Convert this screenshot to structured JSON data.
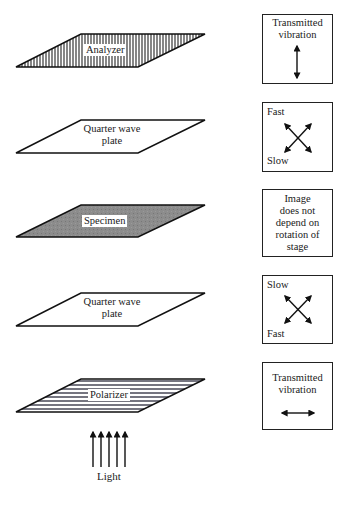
{
  "diagram": {
    "layers": [
      {
        "id": "analyzer",
        "label": "Analyzer",
        "fill": "vertical-stripes"
      },
      {
        "id": "quarter-wave-plate-top",
        "label_line1": "Quarter wave",
        "label_line2": "plate",
        "fill": "white"
      },
      {
        "id": "specimen",
        "label": "Specimen",
        "fill": "#8c8c8c"
      },
      {
        "id": "quarter-wave-plate-bottom",
        "label_line1": "Quarter wave",
        "label_line2": "plate",
        "fill": "white"
      },
      {
        "id": "polarizer",
        "label": "Polarizer",
        "fill": "horizontal-stripes"
      }
    ],
    "info_boxes": [
      {
        "id": "analyzer-info",
        "line1": "Transmitted",
        "line2": "vibration",
        "icon": "vertical-double-arrow-icon"
      },
      {
        "id": "qwp-top-info",
        "top_label": "Fast",
        "bottom_label": "Slow",
        "icon": "crossed-double-arrows-icon"
      },
      {
        "id": "specimen-info",
        "lines": [
          "Image",
          "does not",
          "depend on",
          "rotation of",
          "stage"
        ]
      },
      {
        "id": "qwp-bottom-info",
        "top_label": "Slow",
        "bottom_label": "Fast",
        "icon": "crossed-double-arrows-icon"
      },
      {
        "id": "polarizer-info",
        "line1": "Transmitted",
        "line2": "vibration",
        "icon": "horizontal-double-arrow-icon"
      }
    ],
    "light": {
      "label": "Light",
      "arrow_count": 5,
      "icon": "upward-arrows-icon"
    }
  }
}
